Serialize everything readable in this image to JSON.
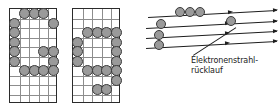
{
  "figure": {
    "type": "raster-scan-illustration",
    "caption_line1": "Elektronenstrahl-",
    "caption_line2": "rücklauf",
    "colors": {
      "dot_fill": "#9a9a9a",
      "dot_stroke": "#3a3a3a",
      "grid_line": "#8d8d8d",
      "grid_border": "#2b2b2b",
      "scan_line": "#1e1e1e",
      "background": "#ffffff"
    }
  },
  "grids": [
    {
      "name": "character-grid-left",
      "cols": 5,
      "rows": 10,
      "dots": [
        [
          1,
          0
        ],
        [
          2,
          0
        ],
        [
          3,
          0
        ],
        [
          4,
          1
        ],
        [
          0,
          1
        ],
        [
          0,
          2
        ],
        [
          0,
          3
        ],
        [
          0,
          4
        ],
        [
          0,
          5
        ],
        [
          3,
          4
        ],
        [
          4,
          4
        ],
        [
          4,
          5
        ],
        [
          1,
          6
        ],
        [
          2,
          6
        ],
        [
          3,
          6
        ],
        [
          4,
          6
        ]
      ]
    },
    {
      "name": "character-grid-right",
      "cols": 5,
      "rows": 10,
      "dots": [
        [
          1,
          2
        ],
        [
          2,
          2
        ],
        [
          3,
          2
        ],
        [
          4,
          2
        ],
        [
          0,
          3
        ],
        [
          0,
          4
        ],
        [
          0,
          5
        ],
        [
          4,
          3
        ],
        [
          4,
          4
        ],
        [
          4,
          5
        ],
        [
          1,
          6
        ],
        [
          2,
          6
        ],
        [
          3,
          6
        ],
        [
          4,
          6
        ],
        [
          4,
          7
        ],
        [
          2,
          8
        ],
        [
          3,
          8
        ]
      ]
    }
  ],
  "scan_diagram": {
    "name": "electron-beam-scan-lines",
    "line_count": 4,
    "lines": [
      {
        "index": 1,
        "label": "scan-line-1"
      },
      {
        "index": 2,
        "label": "scan-line-2"
      },
      {
        "index": 3,
        "label": "scan-line-3"
      },
      {
        "index": 4,
        "label": "scan-line-4"
      }
    ],
    "beam_dots": 6,
    "arrow_count": 6,
    "retrace_label": "Elektronenstrahl-\nrücklauf"
  }
}
